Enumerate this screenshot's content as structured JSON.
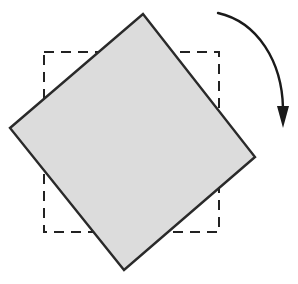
{
  "figure": {
    "canvas": {
      "width": 298,
      "height": 284,
      "background": "#ffffff"
    },
    "shapes": {
      "reference_square": {
        "label": "dashed reference square",
        "style": "dashed",
        "stroke_color": "#222222",
        "stroke_width": 2,
        "dash_pattern": "10 7",
        "fill": "none",
        "x": 44,
        "y": 52,
        "width": 175,
        "height": 180
      },
      "rotated_square": {
        "label": "shaded rotated square",
        "style": "solid",
        "stroke_color": "#2a2a2a",
        "stroke_width": 2.4,
        "fill_color": "#dcdcdc",
        "rotation_degrees": 45,
        "vertices": [
          {
            "name": "top",
            "x": 143,
            "y": 14
          },
          {
            "name": "right",
            "x": 255,
            "y": 157
          },
          {
            "name": "bottom",
            "x": 124,
            "y": 270
          },
          {
            "name": "left",
            "x": 10,
            "y": 128
          }
        ]
      },
      "rotation_arrow": {
        "label": "clockwise rotation arrow",
        "stroke_color": "#1a1a1a",
        "stroke_width": 2.4,
        "direction": "clockwise",
        "start": {
          "x": 218,
          "y": 13
        },
        "control1": {
          "x": 258,
          "y": 22
        },
        "control2": {
          "x": 282,
          "y": 62
        },
        "end": {
          "x": 283,
          "y": 108
        },
        "arrowhead": {
          "tip": {
            "x": 283,
            "y": 128
          },
          "left": {
            "x": 277,
            "y": 106
          },
          "right": {
            "x": 289,
            "y": 106
          }
        }
      }
    }
  }
}
